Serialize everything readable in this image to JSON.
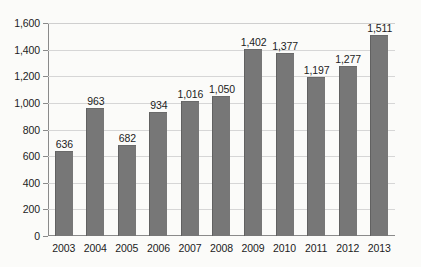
{
  "chart_data": {
    "type": "bar",
    "title": "",
    "subtitle": "",
    "xlabel": "",
    "ylabel": "",
    "categories": [
      "2003",
      "2004",
      "2005",
      "2006",
      "2007",
      "2008",
      "2009",
      "2010",
      "2011",
      "2012",
      "2013"
    ],
    "values": [
      636,
      963,
      682,
      934,
      1016,
      1050,
      1402,
      1377,
      1197,
      1277,
      1511
    ],
    "value_labels": [
      "636",
      "963",
      "682",
      "934",
      "1,016",
      "1,050",
      "1,402",
      "1,377",
      "1,197",
      "1,277",
      "1,511"
    ],
    "ylim": [
      0,
      1600
    ],
    "ytick_values": [
      0,
      200,
      400,
      600,
      800,
      1000,
      1200,
      1400,
      1600
    ],
    "ytick_labels": [
      "0",
      "200",
      "400",
      "600",
      "800",
      "1,000",
      "1,200",
      "1,400",
      "1,600"
    ],
    "grid": true,
    "grid_axis": "y",
    "legend": false,
    "legend_position": "none",
    "series": [
      {
        "name": "",
        "color": "#777777",
        "values": [
          636,
          963,
          682,
          934,
          1016,
          1050,
          1402,
          1377,
          1197,
          1277,
          1511
        ]
      }
    ],
    "colors": {
      "bar_fill": "#777777",
      "bar_edge": "#616161",
      "gridline": "#d6d6d6",
      "axis": "#8a8a8a",
      "text": "#1c1c1c",
      "background": "#fbfbf9"
    }
  }
}
